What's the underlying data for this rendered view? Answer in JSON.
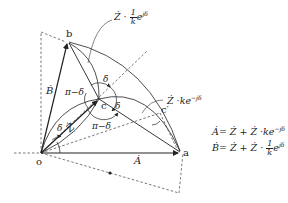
{
  "diagram": {
    "points": {
      "o": {
        "label": "o",
        "x": 41,
        "y": 153
      },
      "a": {
        "label": "a",
        "x": 180,
        "y": 153
      },
      "b": {
        "label": "b",
        "x": 68,
        "y": 42
      },
      "c": {
        "label": "c",
        "x": 99,
        "y": 99
      },
      "c_prime": {
        "label": "c′",
        "x": 160,
        "y": 113
      }
    },
    "vectors": {
      "A": "Ȧ",
      "B": "Ḃ",
      "Z": "Ż"
    },
    "angles": {
      "delta": "δ",
      "pi_minus_delta": "π−δ"
    },
    "annotations": {
      "top": {
        "prefix": "Ż ·",
        "frac_num": "1",
        "frac_den": "k",
        "suffix": "e",
        "sup": "jδ"
      },
      "right": {
        "text": "Ż ·ke",
        "sup": "−jδ"
      }
    },
    "equations": [
      {
        "lhs": "Ȧ",
        "rhs": "= Ż + Ż ·ke",
        "sup": "−jδ"
      },
      {
        "lhs": "Ḃ",
        "rhs": "= Ż + Ż ·",
        "frac_num": "1",
        "frac_den": "k",
        "suffix": "e",
        "sup": "jδ"
      }
    ],
    "colors": {
      "line": "#222222",
      "dash": "#444444",
      "background": "#ffffff"
    }
  }
}
